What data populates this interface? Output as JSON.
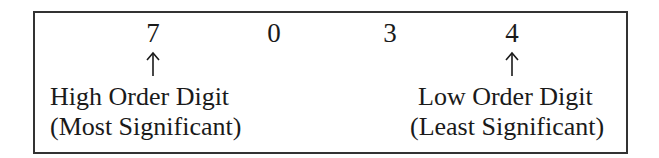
{
  "diagram": {
    "digits": [
      "7",
      "0",
      "3",
      "4"
    ],
    "high": {
      "line1": "High Order Digit",
      "line2": "(Most Significant)"
    },
    "low": {
      "line1": "Low Order Digit",
      "line2": "(Least Significant)"
    },
    "colors": {
      "border": "#333333",
      "text": "#1a1a1a"
    }
  }
}
